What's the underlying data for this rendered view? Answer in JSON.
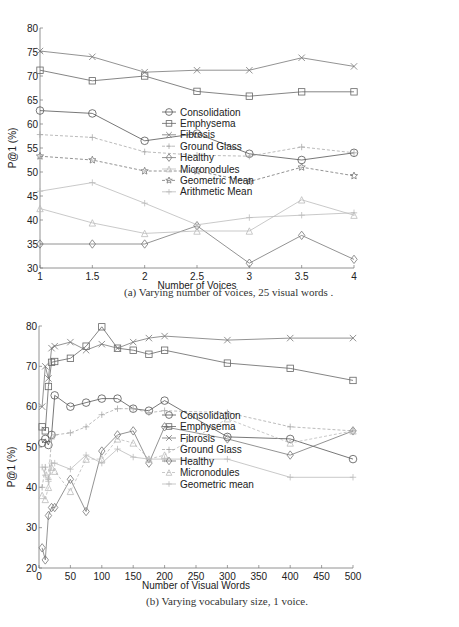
{
  "chart_data": [
    {
      "type": "line",
      "title": "",
      "caption": "(a) Varying number of voices, 25 visual words .",
      "xlabel": "Number of Voices",
      "ylabel": "P@1 (%)",
      "xlim": [
        1,
        4
      ],
      "ylim": [
        30,
        80
      ],
      "x_ticks": [
        "1",
        "1.5",
        "2",
        "2.5",
        "3",
        "3.5",
        "4"
      ],
      "y_ticks": [
        "30",
        "35",
        "40",
        "45",
        "50",
        "55",
        "60",
        "65",
        "70",
        "75",
        "80"
      ],
      "grid": false,
      "legend_position": "right",
      "x": [
        1,
        1.5,
        2,
        2.5,
        3,
        3.5,
        4
      ],
      "series": [
        {
          "name": "Consolidation",
          "marker": "circle",
          "style": "solid",
          "color": "#555555",
          "values": [
            62.8,
            62.2,
            56.5,
            58.0,
            53.8,
            52.5,
            54.0
          ]
        },
        {
          "name": "Emphysema",
          "marker": "square",
          "style": "solid",
          "color": "#666666",
          "values": [
            71.2,
            69.0,
            70.0,
            66.8,
            65.8,
            66.7,
            66.7
          ]
        },
        {
          "name": "Fibrosis",
          "marker": "x",
          "style": "solid",
          "color": "#777777",
          "values": [
            75.2,
            74.0,
            70.8,
            71.2,
            71.2,
            73.8,
            72.0
          ]
        },
        {
          "name": "Ground Glass",
          "marker": "plus",
          "style": "dashed",
          "color": "#aaaaaa",
          "values": [
            57.8,
            57.2,
            54.2,
            53.5,
            53.3,
            55.2,
            54.0
          ]
        },
        {
          "name": "Healthy",
          "marker": "diamond",
          "style": "solid",
          "color": "#777777",
          "values": [
            35.0,
            35.0,
            35.0,
            38.8,
            31.0,
            36.8,
            31.8
          ]
        },
        {
          "name": "Micronodules",
          "marker": "triangle",
          "style": "solid",
          "color": "#bbbbbb",
          "values": [
            42.4,
            39.4,
            37.2,
            37.7,
            37.7,
            44.2,
            41.0
          ]
        },
        {
          "name": "Geometric Mean",
          "marker": "star",
          "style": "dashed",
          "color": "#777777",
          "values": [
            53.3,
            52.5,
            50.2,
            50.2,
            48.0,
            51.0,
            49.2
          ]
        },
        {
          "name": "Arithmetic Mean",
          "marker": "plus",
          "style": "solid",
          "color": "#bbbbbb",
          "values": [
            46.0,
            47.8,
            43.5,
            39.0,
            40.5,
            41.0,
            41.5
          ]
        }
      ]
    },
    {
      "type": "line",
      "title": "",
      "caption": "(b) Varying vocabulary size, 1 voice.",
      "xlabel": "Number of Visual Words",
      "ylabel": "P@1 (%)",
      "xlim": [
        0,
        500
      ],
      "ylim": [
        20,
        80
      ],
      "x_ticks": [
        "0",
        "50",
        "100",
        "150",
        "200",
        "250",
        "300",
        "350",
        "400",
        "450",
        "500"
      ],
      "y_ticks": [
        "20",
        "30",
        "40",
        "50",
        "60",
        "70",
        "80"
      ],
      "grid": false,
      "legend_position": "right",
      "x": [
        5,
        10,
        15,
        20,
        25,
        50,
        75,
        100,
        125,
        150,
        175,
        200,
        300,
        400,
        500
      ],
      "series": [
        {
          "name": "Consolidation",
          "marker": "circle",
          "style": "solid",
          "color": "#555555",
          "values": [
            51.0,
            52.0,
            50.5,
            53.0,
            62.8,
            60.0,
            61.0,
            62.0,
            62.0,
            59.5,
            59.0,
            61.5,
            52.5,
            52.0,
            47.0
          ]
        },
        {
          "name": "Emphysema",
          "marker": "square",
          "style": "solid",
          "color": "#666666",
          "values": [
            55.0,
            54.0,
            65.0,
            71.0,
            71.2,
            72.0,
            75.0,
            79.8,
            74.5,
            74.0,
            73.0,
            74.0,
            70.8,
            69.5,
            66.5
          ]
        },
        {
          "name": "Fibrosis",
          "marker": "x",
          "style": "solid",
          "color": "#777777",
          "values": [
            60.0,
            70.0,
            67.0,
            74.5,
            75.0,
            76.0,
            74.0,
            75.5,
            74.5,
            76.0,
            77.0,
            77.5,
            76.5,
            77.0,
            77.0
          ]
        },
        {
          "name": "Ground Glass",
          "marker": "plus",
          "style": "dashed",
          "color": "#aaaaaa",
          "values": [
            40.0,
            45.0,
            42.0,
            52.0,
            53.0,
            53.5,
            55.0,
            58.0,
            59.5,
            59.5,
            58.5,
            59.0,
            58.5,
            55.0,
            54.0
          ]
        },
        {
          "name": "Healthy",
          "marker": "diamond",
          "style": "solid",
          "color": "#777777",
          "values": [
            25.0,
            22.0,
            33.0,
            35.0,
            35.0,
            42.0,
            34.0,
            49.0,
            53.0,
            54.0,
            46.0,
            55.0,
            52.0,
            48.0,
            54.0
          ]
        },
        {
          "name": "Micronodules",
          "marker": "triangle",
          "style": "dashed",
          "color": "#bbbbbb",
          "values": [
            38.0,
            37.0,
            40.0,
            45.0,
            44.0,
            39.0,
            47.0,
            47.0,
            52.0,
            51.0,
            47.0,
            48.0,
            57.0,
            51.0,
            54.0
          ]
        },
        {
          "name": "Geometric mean",
          "marker": "plus",
          "style": "solid",
          "color": "#bbbbbb",
          "values": [
            45.0,
            43.0,
            41.5,
            46.0,
            46.0,
            44.5,
            48.0,
            46.0,
            49.5,
            47.5,
            47.0,
            47.0,
            47.0,
            42.5,
            42.5
          ]
        }
      ]
    }
  ]
}
